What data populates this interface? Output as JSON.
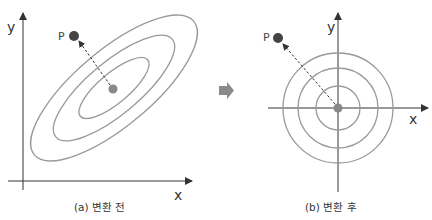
{
  "panels": [
    {
      "id": "a",
      "caption": "(a) 변환 전",
      "axis_x_label": "x",
      "axis_y_label": "y",
      "point_label": "P",
      "shape": "concentric rotated ellipses",
      "ellipse_count": 3
    },
    {
      "id": "b",
      "caption": "(b) 변환 후",
      "axis_x_label": "x",
      "axis_y_label": "y",
      "point_label": "P",
      "shape": "concentric circles",
      "circle_count": 3
    }
  ],
  "transition_icon": "right-arrow-icon",
  "colors": {
    "axis": "#333333",
    "contour": "#999999",
    "point_p": "#444444",
    "center_point": "#888888",
    "arrow_icon": "#8a8a8a"
  }
}
